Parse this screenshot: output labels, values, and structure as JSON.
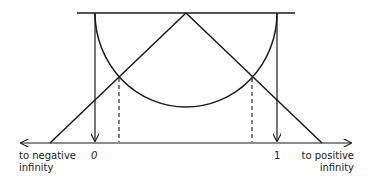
{
  "diagram": {
    "labels": {
      "neg_line1": "to negative",
      "neg_line2": "infinity",
      "zero": "0",
      "one": "1",
      "pos_line1": "to positive",
      "pos_line2": "infinity"
    },
    "colors": {
      "stroke": "#1a1a1a",
      "background": "#ffffff"
    }
  }
}
